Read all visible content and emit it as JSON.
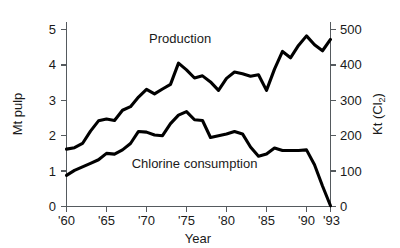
{
  "chart_data": {
    "type": "line",
    "title": "",
    "xlabel": "Year",
    "ylabel": "Mt pulp",
    "y2label": "Kt (Cl2)",
    "y2label_main": "Kt (Cl",
    "y2label_sub": "2",
    "y2label_tail": ")",
    "grid": false,
    "legend_position": "inline-annotation",
    "xlim": [
      1960,
      1993
    ],
    "ylim": [
      0,
      5.2
    ],
    "y2lim": [
      0,
      520
    ],
    "x_tick_values": [
      1960,
      1965,
      1970,
      1975,
      1980,
      1985,
      1990,
      1993
    ],
    "x_tick_labels": [
      "'60",
      "'65",
      "'70",
      "'75",
      "'80",
      "'85",
      "'90",
      "'93"
    ],
    "y_tick_values": [
      0,
      1,
      2,
      3,
      4,
      5
    ],
    "y_tick_labels": [
      "0",
      "1",
      "2",
      "3",
      "4",
      "5"
    ],
    "y2_tick_values": [
      0,
      100,
      200,
      300,
      400,
      500
    ],
    "y2_tick_labels": [
      "0",
      "100",
      "200",
      "300",
      "400",
      "500"
    ],
    "x": [
      1960,
      1961,
      1962,
      1963,
      1964,
      1965,
      1966,
      1967,
      1968,
      1969,
      1970,
      1971,
      1972,
      1973,
      1974,
      1975,
      1976,
      1977,
      1978,
      1979,
      1980,
      1981,
      1982,
      1983,
      1984,
      1985,
      1986,
      1987,
      1988,
      1989,
      1990,
      1991,
      1992,
      1993
    ],
    "series": [
      {
        "name": "Production",
        "unit": "Mt pulp",
        "axis": "left",
        "color": "#000000",
        "annotation": "Production",
        "annotation_x": 1974.2,
        "annotation_y": 4.62,
        "values": [
          1.62,
          1.66,
          1.78,
          2.13,
          2.42,
          2.47,
          2.43,
          2.72,
          2.82,
          3.09,
          3.31,
          3.18,
          3.32,
          3.45,
          4.05,
          3.86,
          3.63,
          3.69,
          3.52,
          3.28,
          3.62,
          3.8,
          3.75,
          3.68,
          3.72,
          3.28,
          3.88,
          4.38,
          4.2,
          4.55,
          4.82,
          4.57,
          4.4,
          4.72
        ]
      },
      {
        "name": "Chlorine consumption",
        "unit": "Kt (Cl2)",
        "axis": "right",
        "color": "#000000",
        "annotation": "Chlorine consumption",
        "annotation_x": 1976.0,
        "annotation_y": 1.08,
        "values_kt": [
          88,
          102,
          112,
          122,
          132,
          150,
          148,
          160,
          178,
          212,
          210,
          202,
          200,
          234,
          258,
          268,
          245,
          243,
          195,
          200,
          205,
          212,
          205,
          168,
          142,
          148,
          165,
          158,
          158,
          158,
          160,
          118,
          58,
          2
        ]
      }
    ]
  },
  "axis_titles": {
    "left": "Mt pulp",
    "bottom": "Year"
  }
}
